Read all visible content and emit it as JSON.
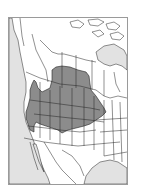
{
  "map": {
    "type": "range-map",
    "region": "western North America",
    "colors": {
      "land": "#ffffff",
      "water": "#e2e2e2",
      "range": "#8c8c8c",
      "borders": "#222222",
      "frame": "#9a9a9a"
    },
    "legend": []
  }
}
